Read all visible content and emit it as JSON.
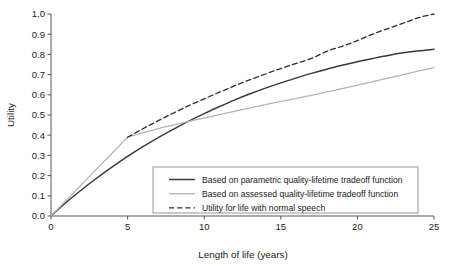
{
  "chart_data": {
    "type": "line",
    "title": "",
    "xlabel": "Length of life (years)",
    "ylabel": "Utility",
    "xlim": [
      0,
      25
    ],
    "ylim": [
      0,
      1.0
    ],
    "grid": false,
    "legend_position": "lower-right-inside",
    "xticks": [
      "0",
      "5",
      "10",
      "15",
      "20",
      "25"
    ],
    "xtick_values": [
      0,
      5,
      10,
      15,
      20,
      25
    ],
    "yticks": [
      "0.0",
      "0.1",
      "0.2",
      "0.3",
      "0.4",
      "0.5",
      "0.6",
      "0.7",
      "0.8",
      "0.9",
      "1.0"
    ],
    "ytick_values": [
      0.0,
      0.1,
      0.2,
      0.3,
      0.4,
      0.5,
      0.6,
      0.7,
      0.8,
      0.9,
      1.0
    ],
    "series": [
      {
        "name": "Based on parametric quality-lifetime tradeoff function",
        "style": "solid",
        "color": "#3a3a3a",
        "width": 1.5,
        "x": [
          0,
          1,
          2,
          3,
          4,
          5,
          6,
          7,
          8,
          9,
          10,
          11,
          12,
          13,
          14,
          15,
          16,
          17,
          18,
          19,
          20,
          21,
          22,
          23,
          24,
          25
        ],
        "values": [
          0.0,
          0.068,
          0.13,
          0.188,
          0.243,
          0.295,
          0.343,
          0.388,
          0.43,
          0.47,
          0.507,
          0.542,
          0.575,
          0.605,
          0.633,
          0.659,
          0.683,
          0.706,
          0.727,
          0.746,
          0.764,
          0.78,
          0.795,
          0.808,
          0.818,
          0.825
        ]
      },
      {
        "name": "Based on assessed quality-lifetime tradeoff function",
        "style": "solid",
        "color": "#b4b4b4",
        "width": 1.3,
        "x": [
          0,
          5,
          7,
          9,
          11,
          13,
          15,
          17,
          19,
          21,
          23,
          25
        ],
        "values": [
          0.0,
          0.39,
          0.432,
          0.468,
          0.502,
          0.535,
          0.567,
          0.597,
          0.63,
          0.665,
          0.7,
          0.735
        ]
      },
      {
        "name": "Utility for life with normal speech",
        "style": "dashed",
        "color": "#2f2f2f",
        "width": 1.3,
        "x": [
          5,
          6,
          7,
          8,
          9,
          10,
          11,
          12,
          13,
          14,
          15,
          16,
          17,
          18,
          19,
          20,
          21,
          22,
          23,
          24,
          25
        ],
        "values": [
          0.39,
          0.432,
          0.472,
          0.51,
          0.546,
          0.58,
          0.613,
          0.645,
          0.675,
          0.703,
          0.73,
          0.755,
          0.78,
          0.815,
          0.84,
          0.868,
          0.9,
          0.928,
          0.955,
          0.982,
          1.0
        ]
      }
    ],
    "annotations": {
      "kink_point": {
        "x": 5,
        "y": 0.39,
        "note": "assessed and normal-speech curves branch here"
      }
    }
  },
  "legend": {
    "entries": [
      {
        "label": "Based on parametric quality-lifetime tradeoff function",
        "swatch": "solid-dark-line-swatch"
      },
      {
        "label": "Based on assessed quality-lifetime tradeoff function",
        "swatch": "solid-gray-line-swatch"
      },
      {
        "label": "Utility for life with normal speech",
        "swatch": "dashed-line-swatch"
      }
    ]
  },
  "colors": {
    "parametric": "#3a3a3a",
    "assessed": "#b4b4b4",
    "normal_speech": "#2f2f2f",
    "axis": "#555555",
    "legend_border": "#8a8a8a",
    "background": "#ffffff"
  }
}
